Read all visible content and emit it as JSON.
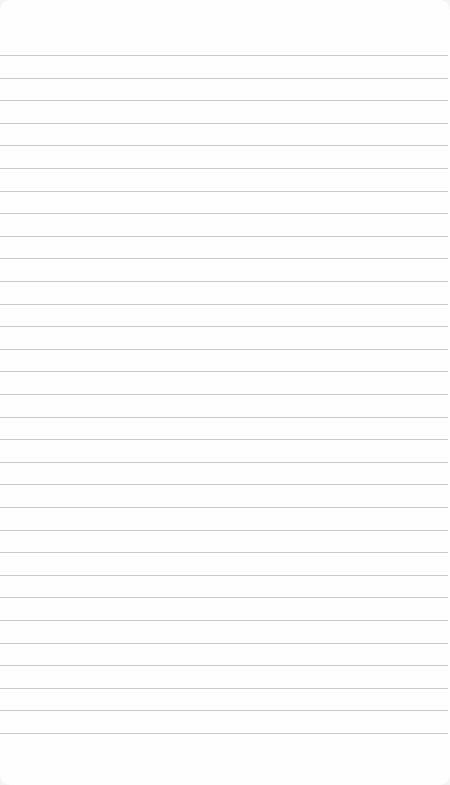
{
  "page": {
    "type": "lined-notepad",
    "background_color": "#fefefe",
    "line_color": "#c8c8c8",
    "first_line_y": 55,
    "line_spacing": 22.6,
    "line_count": 31,
    "text": ""
  }
}
